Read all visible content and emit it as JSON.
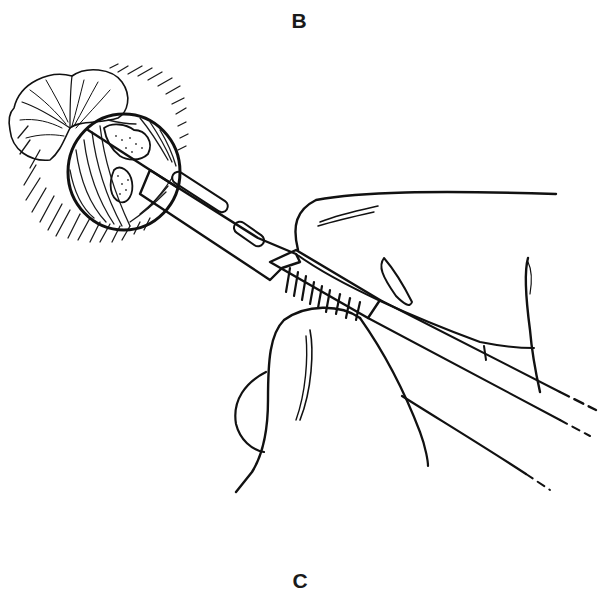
{
  "figure": {
    "panel_labels": {
      "top": "B",
      "bottom": "C"
    },
    "colors": {
      "ink": "#111111",
      "background": "#ffffff"
    }
  }
}
